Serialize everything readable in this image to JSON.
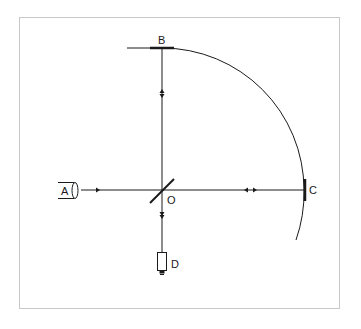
{
  "figure": {
    "type": "Fizeau/Foucault rotating-mirror style apparatus (light path diagram)",
    "frame_color": "#c8c8c8",
    "line_color": "#1a1a1a"
  },
  "labels": {
    "A": "A",
    "B": "B",
    "C": "C",
    "D": "D",
    "O": "O"
  },
  "components": [
    {
      "id": "A",
      "role": "light source",
      "shape": "cylinder"
    },
    {
      "id": "O",
      "role": "beam splitter (half-silvered mirror)",
      "shape": "diagonal line"
    },
    {
      "id": "B",
      "role": "mirror (top)",
      "shape": "thick horizontal bar"
    },
    {
      "id": "C",
      "role": "mirror (right)",
      "shape": "thick vertical bar"
    },
    {
      "id": "D",
      "role": "detector",
      "shape": "rectangle with base"
    }
  ],
  "paths": [
    {
      "from": "A",
      "to": "O",
      "direction": "forward"
    },
    {
      "from": "O",
      "to": "B",
      "direction": "bidirectional"
    },
    {
      "from": "O",
      "to": "C",
      "direction": "bidirectional"
    },
    {
      "from": "O",
      "to": "D",
      "direction": "forward"
    }
  ],
  "arc": {
    "description": "quarter-circle arc centered at O through B and C"
  }
}
